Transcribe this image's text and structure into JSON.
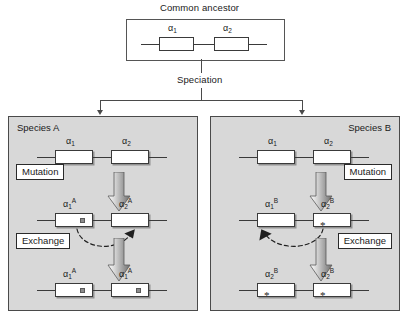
{
  "diagram": {
    "title": "Common ancestor",
    "speciation_label": "Speciation",
    "ancestor": {
      "genes": [
        {
          "name": "α",
          "sub": "1",
          "sup": "",
          "marker": "none"
        },
        {
          "name": "α",
          "sub": "2",
          "sup": "",
          "marker": "none"
        }
      ]
    },
    "panels": [
      {
        "id": "species-a",
        "label": "Species A",
        "label_align": "left",
        "marker_type": "square",
        "exchange_direction": "right",
        "steps": [
          {
            "label": "Mutation"
          },
          {
            "label": "Exchange"
          }
        ],
        "rows": [
          {
            "row": "initial",
            "genes": [
              {
                "name": "α",
                "sub": "1",
                "sup": "",
                "marker": "none"
              },
              {
                "name": "α",
                "sub": "2",
                "sup": "",
                "marker": "none"
              }
            ]
          },
          {
            "row": "after-mutation",
            "genes": [
              {
                "name": "α",
                "sub": "1",
                "sup": "A",
                "marker": "square"
              },
              {
                "name": "α",
                "sub": "2",
                "sup": "A",
                "marker": "none"
              }
            ]
          },
          {
            "row": "after-exchange",
            "genes": [
              {
                "name": "α",
                "sub": "1",
                "sup": "A",
                "marker": "square"
              },
              {
                "name": "α",
                "sub": "1",
                "sup": "A",
                "marker": "square"
              }
            ]
          }
        ]
      },
      {
        "id": "species-b",
        "label": "Species B",
        "label_align": "right",
        "marker_type": "asterisk",
        "exchange_direction": "left",
        "steps": [
          {
            "label": "Mutation"
          },
          {
            "label": "Exchange"
          }
        ],
        "rows": [
          {
            "row": "initial",
            "genes": [
              {
                "name": "α",
                "sub": "1",
                "sup": "",
                "marker": "none"
              },
              {
                "name": "α",
                "sub": "2",
                "sup": "",
                "marker": "none"
              }
            ]
          },
          {
            "row": "after-mutation",
            "genes": [
              {
                "name": "α",
                "sub": "1",
                "sup": "B",
                "marker": "none"
              },
              {
                "name": "α",
                "sub": "2",
                "sup": "B",
                "marker": "asterisk"
              }
            ]
          },
          {
            "row": "after-exchange",
            "genes": [
              {
                "name": "α",
                "sub": "2",
                "sup": "B",
                "marker": "asterisk"
              },
              {
                "name": "α",
                "sub": "2",
                "sup": "B",
                "marker": "asterisk"
              }
            ]
          }
        ]
      }
    ],
    "colors": {
      "panel_fill": "#d8d8d8",
      "panel_border": "#4a4a4a",
      "gene_fill": "#ffffff",
      "gene_border": "#3a3a3a",
      "marker_fill": "#8d8d8d",
      "arrow_light": "#ffffff",
      "arrow_dark": "#6e6e6e",
      "line": "#4a4a4a"
    }
  }
}
